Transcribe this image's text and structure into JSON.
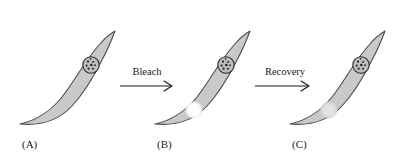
{
  "figure": {
    "background_color": "#ffffff",
    "width": 409,
    "height": 167
  },
  "colors": {
    "cell_fill": "#c9c9c9",
    "cell_outline": "#4d4d4d",
    "nucleus_fill": "#bdbdbd",
    "nucleus_outline": "#2b2b2b",
    "chromatin": "#242424",
    "bleached_spot_bright": "#ffffff",
    "bleached_spot_faded": "#dcdcdc",
    "text": "#1a1a1a",
    "arrow": "#1a1a1a"
  },
  "panels": [
    {
      "id": "A",
      "label": "(A)",
      "state": "unbleached",
      "has_nucleus": true,
      "spot": null
    },
    {
      "id": "B",
      "label": "(B)",
      "state": "bleached",
      "has_nucleus": true,
      "spot": {
        "name": "bleached-spot",
        "brightness": "bright",
        "color": "#ffffff"
      }
    },
    {
      "id": "C",
      "label": "(C)",
      "state": "recovered",
      "has_nucleus": true,
      "spot": {
        "name": "recovering-spot",
        "brightness": "faded",
        "color": "#dcdcdc"
      }
    }
  ],
  "arrows": [
    {
      "id": "bleach",
      "label": "Bleach",
      "from": "A",
      "to": "B",
      "direction": "right"
    },
    {
      "id": "recovery",
      "label": "Recovery",
      "from": "B",
      "to": "C",
      "direction": "right"
    }
  ]
}
